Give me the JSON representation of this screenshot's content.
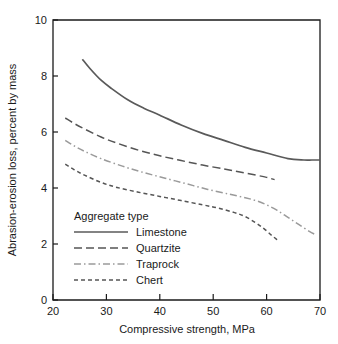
{
  "chart_data": {
    "type": "line",
    "title": "",
    "xlabel": "Compressive strength, MPa",
    "ylabel": "Abrasion-erosion loss, percent by mass",
    "xlim": [
      20,
      70
    ],
    "ylim": [
      0,
      10
    ],
    "xticks": [
      20,
      30,
      40,
      50,
      60,
      70
    ],
    "yticks": [
      0,
      2,
      4,
      6,
      8,
      10
    ],
    "xtick_labels": [
      "20",
      "30",
      "40",
      "50",
      "60",
      "70"
    ],
    "ytick_labels": [
      "0",
      "2",
      "4",
      "6",
      "8",
      "10"
    ],
    "grid": false,
    "legend_position": "lower left inside axes",
    "legend_title": "Aggregate type",
    "series": [
      {
        "name": "Limestone",
        "color": "#5a5a5a",
        "linestyle": "solid",
        "dasharray": "",
        "width": 1.7,
        "x": [
          25.5,
          27,
          29,
          31,
          34,
          37,
          40,
          44,
          48,
          52,
          56,
          60,
          64,
          67,
          68.5,
          70
        ],
        "y": [
          8.6,
          8.25,
          7.85,
          7.55,
          7.15,
          6.85,
          6.6,
          6.25,
          5.95,
          5.7,
          5.45,
          5.25,
          5.05,
          5.0,
          5.0,
          5.0
        ]
      },
      {
        "name": "Quartzite",
        "color": "#555555",
        "linestyle": "long dash",
        "dasharray": "8,4",
        "width": 1.5,
        "x": [
          22.3,
          24,
          26,
          29,
          32,
          36,
          40,
          44,
          48,
          52,
          55,
          58,
          60,
          61.5
        ],
        "y": [
          6.5,
          6.3,
          6.1,
          5.82,
          5.6,
          5.35,
          5.15,
          4.98,
          4.82,
          4.68,
          4.57,
          4.46,
          4.38,
          4.3
        ]
      },
      {
        "name": "Traprock",
        "color": "#9a9a9a",
        "linestyle": "dash-dot",
        "dasharray": "7,3,1.5,3",
        "width": 1.5,
        "x": [
          22.3,
          24,
          26,
          29,
          33,
          37,
          41,
          45,
          49,
          53,
          56,
          58,
          60,
          62,
          64,
          66,
          68,
          69
        ],
        "y": [
          5.7,
          5.5,
          5.3,
          5.05,
          4.78,
          4.55,
          4.35,
          4.15,
          3.95,
          3.78,
          3.65,
          3.55,
          3.4,
          3.2,
          2.95,
          2.7,
          2.45,
          2.35
        ]
      },
      {
        "name": "Chert",
        "color": "#555555",
        "linestyle": "short dash",
        "dasharray": "4,3",
        "width": 1.5,
        "x": [
          22.3,
          24,
          26,
          29,
          32,
          36,
          40,
          44,
          48,
          51,
          54,
          56,
          58,
          59.5,
          61,
          62
        ],
        "y": [
          4.85,
          4.65,
          4.45,
          4.2,
          4.02,
          3.85,
          3.7,
          3.55,
          3.4,
          3.28,
          3.12,
          2.98,
          2.75,
          2.55,
          2.3,
          2.15
        ]
      }
    ]
  },
  "axes": {
    "x_title": "Compressive strength, MPa",
    "y_title": "Abrasion-erosion loss, percent by mass"
  },
  "legend": {
    "title": "Aggregate type",
    "entries": [
      {
        "label": "Limestone"
      },
      {
        "label": "Quartzite"
      },
      {
        "label": "Traprock"
      },
      {
        "label": "Chert"
      }
    ]
  }
}
